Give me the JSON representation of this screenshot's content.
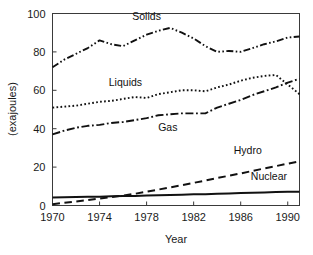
{
  "chart_data": {
    "type": "line",
    "title": "",
    "xlabel": "Year",
    "ylabel": "(exajoules)",
    "xlim": [
      1970,
      1991
    ],
    "ylim": [
      0,
      100
    ],
    "xticks": [
      1970,
      1974,
      1978,
      1982,
      1986,
      1990
    ],
    "yticks": [
      0,
      20,
      40,
      60,
      80,
      100
    ],
    "grid": false,
    "legend": "inline-labels",
    "x": [
      1970,
      1971,
      1972,
      1973,
      1974,
      1975,
      1976,
      1977,
      1978,
      1979,
      1980,
      1981,
      1982,
      1983,
      1984,
      1985,
      1986,
      1987,
      1988,
      1989,
      1990,
      1991
    ],
    "series": [
      {
        "name": "Solids",
        "label": "Solids",
        "linestyle": "dash-dot-dot",
        "values": [
          72,
          76,
          79,
          82,
          86,
          84,
          83,
          86,
          89,
          91,
          92.5,
          90,
          87,
          83,
          80,
          80.5,
          80,
          82,
          84,
          85.5,
          87.5,
          88
        ]
      },
      {
        "name": "Liquids",
        "label": "Liquids",
        "linestyle": "dotted",
        "values": [
          51,
          51.5,
          52,
          53,
          54,
          54.5,
          55.5,
          56.5,
          56,
          58,
          59,
          60,
          60,
          59.5,
          61.5,
          63,
          65,
          66.5,
          67.5,
          68,
          63,
          58
        ]
      },
      {
        "name": "Gas",
        "label": "Gas",
        "linestyle": "dash-dot",
        "values": [
          37,
          39,
          40.5,
          41.5,
          42,
          43,
          43.5,
          44.5,
          45.5,
          47,
          47.5,
          48,
          48,
          48,
          51,
          53,
          55,
          57.5,
          59.5,
          61.5,
          64,
          66
        ]
      },
      {
        "name": "Hydro",
        "label": "Hydro",
        "linestyle": "dashed",
        "values": [
          0.7,
          1.4,
          2.1,
          2.8,
          3.6,
          4.4,
          5.2,
          6.1,
          7.2,
          8.3,
          9.4,
          10.6,
          11.8,
          13.0,
          14.3,
          15.5,
          16.7,
          18.0,
          19.3,
          20.5,
          21.8,
          23.0
        ]
      },
      {
        "name": "Nuclear",
        "label": "Nuclear",
        "linestyle": "solid",
        "values": [
          4.2,
          4.3,
          4.4,
          4.5,
          4.6,
          4.8,
          4.9,
          5.0,
          5.2,
          5.3,
          5.5,
          5.6,
          5.8,
          5.9,
          6.1,
          6.3,
          6.5,
          6.7,
          6.8,
          7.0,
          7.1,
          7.2
        ]
      }
    ],
    "annotations": [
      {
        "text": "Solids",
        "x": 1978.0,
        "y": 96.5
      },
      {
        "text": "Liquids",
        "x": 1976.2,
        "y": 62.5
      },
      {
        "text": "Gas",
        "x": 1979.8,
        "y": 39.0
      },
      {
        "text": "Hydro",
        "x": 1986.6,
        "y": 27.0
      },
      {
        "text": "Nuclear",
        "x": 1988.4,
        "y": 13.5
      }
    ],
    "colors": {
      "line": "#111111",
      "axis": "#3a3a3a",
      "text": "#1a1a1a",
      "background": "#ffffff"
    }
  }
}
